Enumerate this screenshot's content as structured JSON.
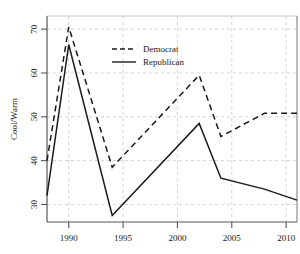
{
  "chart_data": {
    "type": "line",
    "title": "",
    "xlabel": "",
    "ylabel": "Cool/Warm",
    "xlim": [
      1988,
      2011
    ],
    "ylim": [
      26,
      73
    ],
    "xticks": [
      1990,
      1995,
      2000,
      2005,
      2010
    ],
    "xtick_labels": [
      "1990",
      "1995",
      "2000",
      "2005",
      "2010"
    ],
    "yticks": [
      30,
      40,
      50,
      60,
      70
    ],
    "ytick_labels": [
      "30",
      "40",
      "50",
      "60",
      "70"
    ],
    "grid": true,
    "grid_style": "dashed",
    "legend_position": "upper-center",
    "series": [
      {
        "name": "Democrat",
        "style": "dashed",
        "color": "#1a1a1a",
        "x": [
          1988,
          1990,
          1994,
          2002,
          2004,
          2008,
          2011
        ],
        "values": [
          40.0,
          70.5,
          38.5,
          59.5,
          45.5,
          50.8,
          50.8
        ]
      },
      {
        "name": "Republican",
        "style": "solid",
        "color": "#1a1a1a",
        "x": [
          1988,
          1990,
          1994,
          2002,
          2004,
          2008,
          2011
        ],
        "values": [
          32.0,
          66.5,
          27.5,
          48.5,
          36.0,
          33.5,
          31.0
        ]
      }
    ]
  },
  "legend": {
    "items": [
      {
        "label": "Democrat",
        "style": "dashed"
      },
      {
        "label": "Republican",
        "style": "solid"
      }
    ]
  },
  "axes": {
    "y_axis_label": "Cool/Warm"
  },
  "colors": {
    "line": "#1a1a1a",
    "grid": "#c8c8c8",
    "axis": "#555555",
    "background": "#ffffff"
  }
}
